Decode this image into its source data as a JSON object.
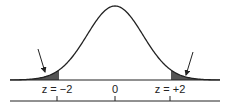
{
  "diagram": {
    "type": "normal-distribution-two-tailed",
    "curve": {
      "mean": 0,
      "sd": 1,
      "stroke": "#222222"
    },
    "shaded_tails": {
      "left_below": -2,
      "right_above": 2,
      "fill": "#555555"
    },
    "labels": {
      "left": "z = −2",
      "center": "0",
      "right": "z = +2"
    },
    "ticks": [
      -2,
      0,
      2
    ],
    "arrows": [
      {
        "target": "left-tail"
      },
      {
        "target": "right-tail"
      }
    ]
  }
}
